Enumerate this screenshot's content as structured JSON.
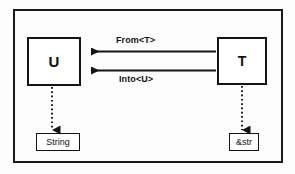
{
  "diagram": {
    "frame": {
      "name": "outer-frame"
    },
    "nodes": [
      {
        "id": "u",
        "label": "U",
        "kind": "generic-type"
      },
      {
        "id": "t",
        "label": "T",
        "kind": "generic-type"
      },
      {
        "id": "string",
        "label": "String",
        "kind": "concrete-type"
      },
      {
        "id": "str",
        "label": "&str",
        "kind": "concrete-type"
      }
    ],
    "edges": [
      {
        "id": "from",
        "label": "From<T>",
        "from": "t",
        "to": "u",
        "style": "solid",
        "direction": "left",
        "label_position": "above"
      },
      {
        "id": "into",
        "label": "Into<U>",
        "from": "t",
        "to": "u",
        "style": "solid",
        "direction": "left",
        "label_position": "below"
      },
      {
        "id": "u-to-string",
        "label": "",
        "from": "u",
        "to": "string",
        "style": "dotted",
        "direction": "down"
      },
      {
        "id": "t-to-str",
        "label": "",
        "from": "t",
        "to": "str",
        "style": "dotted",
        "direction": "down"
      }
    ]
  },
  "colors": {
    "stroke": "#141414",
    "frame": "#1a1a1a",
    "background": "#fcfcfc",
    "box_fill": "#ffffff",
    "text": "#111111"
  }
}
